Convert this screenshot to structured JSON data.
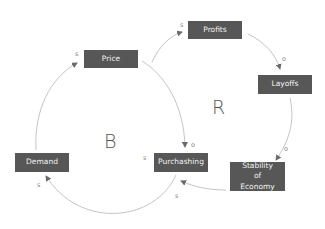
{
  "diagram": {
    "type": "causal-loop",
    "nodes": {
      "price": "Price",
      "profits": "Profits",
      "layoffs": "Layoffs",
      "demand": "Demand",
      "purchashing": "Purchashing",
      "stability": "Stability of Economy"
    },
    "loops": {
      "balancing": "B",
      "reinforcing": "R"
    },
    "edges": [
      {
        "from": "Demand",
        "to": "Price",
        "polarity": "s"
      },
      {
        "from": "Price",
        "to": "Purchashing",
        "polarity": "o"
      },
      {
        "from": "Purchashing",
        "to": "Demand",
        "polarity": "s"
      },
      {
        "from": "Purchashing",
        "to": "Profits",
        "polarity": "s"
      },
      {
        "from": "Profits",
        "to": "Layoffs",
        "polarity": "o"
      },
      {
        "from": "Layoffs",
        "to": "Stability of Economy",
        "polarity": "o"
      },
      {
        "from": "Stability of Economy",
        "to": "Purchashing",
        "polarity": "s"
      }
    ],
    "colors": {
      "node_fill": "#575757",
      "node_text": "#f2f2f2",
      "link": "#b5b5b5",
      "polarity": "#8a8a8a"
    }
  }
}
